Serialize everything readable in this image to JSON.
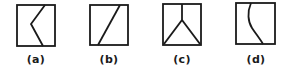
{
  "figure": {
    "stroke_color": "#1a1a1a",
    "background": "#ffffff",
    "panels": [
      {
        "id": "a",
        "label": "(a)",
        "description": "Square with a zigzag line: from top right-of-center to left-middle point, then down to bottom right-of-center"
      },
      {
        "id": "b",
        "label": "(b)",
        "description": "Square with a single straight diagonal line from top-right to bottom-left"
      },
      {
        "id": "c",
        "label": "(c)",
        "description": "Square with a vertical line from top-center splitting into two diagonals to bottom corners (Y shape)"
      },
      {
        "id": "d",
        "label": "(d)",
        "description": "Square with a single curved line from top left-of-center to bottom right-of-center"
      }
    ]
  }
}
